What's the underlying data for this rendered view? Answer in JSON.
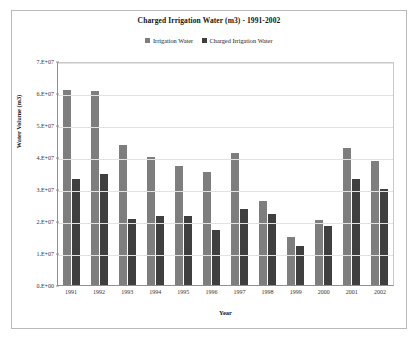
{
  "chart_data": {
    "type": "bar",
    "title": "Charged Irrigation Water (m3) - 1991-2002",
    "xlabel": "Year",
    "ylabel": "Water Volume (m3)",
    "categories": [
      "1991",
      "1992",
      "1993",
      "1994",
      "1995",
      "1996",
      "1997",
      "1998",
      "1999",
      "2000",
      "2001",
      "2002"
    ],
    "series": [
      {
        "name": "Irrigation Water",
        "color": "#7e7e7e",
        "values": [
          61000000,
          60500000,
          43800000,
          40000000,
          37200000,
          35300000,
          41100000,
          26300000,
          15000000,
          20400000,
          42700000,
          38600000
        ]
      },
      {
        "name": "Charged Irrigation Water",
        "color": "#3f3f3f",
        "values": [
          33200000,
          34800000,
          20700000,
          21600000,
          21600000,
          17200000,
          23800000,
          22200000,
          12200000,
          18500000,
          33200000,
          30000000
        ]
      }
    ],
    "ylim": [
      0,
      70000000
    ],
    "ytick_labels": [
      "7.E+07",
      "6.E+07",
      "5.E+07",
      "4.E+07",
      "3.E+07",
      "2.E+07",
      "1.E+07",
      "0.E+00"
    ],
    "ytick_values": [
      70000000,
      60000000,
      50000000,
      40000000,
      30000000,
      20000000,
      10000000,
      0
    ],
    "grid": true,
    "legend_position": "top-center"
  }
}
